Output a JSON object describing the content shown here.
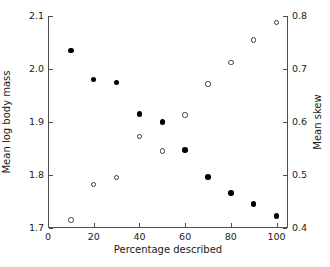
{
  "chart_data": {
    "type": "scatter",
    "title": "",
    "xlabel": "Percentage described",
    "ylabel": "Mean log body mass",
    "y2label": "Mean skew",
    "xlim": [
      0,
      105
    ],
    "ylim": [
      1.7,
      2.1
    ],
    "y2lim": [
      0.4,
      0.8
    ],
    "grid": false,
    "legend": "none",
    "xticks": [
      0,
      20,
      40,
      60,
      80,
      100
    ],
    "xticklabels": [
      "0",
      "20",
      "40",
      "60",
      "80",
      "100"
    ],
    "yticks": [
      1.7,
      1.8,
      1.9,
      2.0,
      2.1
    ],
    "yticklabels": [
      "1.7",
      "1.8",
      "1.9",
      "2.0",
      "2.1"
    ],
    "y2ticks": [
      0.4,
      0.5,
      0.6,
      0.7,
      0.8
    ],
    "y2ticklabels": [
      "0.4",
      "0.5",
      "0.6",
      "0.7",
      "0.8"
    ],
    "x": [
      10,
      20,
      30,
      40,
      50,
      60,
      70,
      80,
      90,
      100
    ],
    "series": [
      {
        "name": "Mean log body mass",
        "marker": "filled-circle",
        "axis": "left",
        "color": "#000000",
        "values": [
          2.035,
          1.98,
          1.975,
          1.915,
          1.9,
          1.847,
          1.796,
          1.766,
          1.745,
          1.723
        ]
      },
      {
        "name": "Mean skew",
        "marker": "open-circle",
        "axis": "right",
        "color": "#3a3a3a",
        "values": [
          0.415,
          0.482,
          0.495,
          0.573,
          0.545,
          0.613,
          0.672,
          0.712,
          0.755,
          0.788
        ]
      }
    ]
  }
}
